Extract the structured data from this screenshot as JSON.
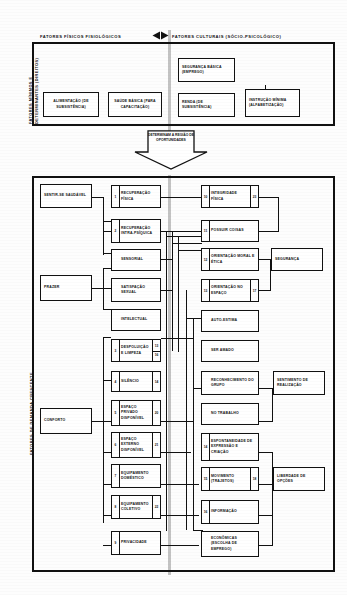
{
  "headers": {
    "left": "FATORES FÍSICOS FISIOLÓGICOS",
    "right": "FATORES CULTURAIS (SÓCIO-PSICOLÓGICO)",
    "arrow_icon": "double-arrow-horizontal-icon"
  },
  "side_labels": {
    "top_panel": "FATORES MÍNIMOS E DETERMINANTES (DIREITOS)",
    "main_panel": "FATORES DE DEMANDA CRESCENTE"
  },
  "top_panel": {
    "boxes": [
      {
        "id": "alimentacao",
        "text": "ALIMENTAÇÃO (DE SUBSISTÊNCIA)"
      },
      {
        "id": "saude-basica",
        "text": "SAÚDE BÁSICA (PARA CAPACITAÇÃO)"
      },
      {
        "id": "seguranca-basica",
        "text": "SEGURANÇA BÁSICA (EMPREGO)"
      },
      {
        "id": "renda",
        "text": "RENDA (DE SUBSISTÊNCIA)"
      },
      {
        "id": "instrucao-minima",
        "text": "INSTRUÇÃO MÍNIMA (ALFABETIZAÇÃO)"
      }
    ]
  },
  "connector": {
    "label": "DETERMINAM A REGIÃO DE OPORTUNIDADES"
  },
  "main_panel": {
    "col1": [
      {
        "id": "sentir-se-saudavel",
        "text": "SENTIR-SE SAUDÁVEL"
      },
      {
        "id": "prazer",
        "text": "PRAZER"
      },
      {
        "id": "conforto",
        "text": "CONFORTO"
      }
    ],
    "col2": [
      {
        "id": "recuperacao-fisica",
        "text": "RECUPERAÇÃO FÍSICA",
        "nl": "1",
        "nr": ""
      },
      {
        "id": "recuperacao-intra",
        "text": "RECUPERAÇÃO INTRA-PSÍQUICA",
        "nl": "2",
        "nr": ""
      },
      {
        "id": "sensorial",
        "text": "SENSORIAL",
        "nl": "",
        "nr": ""
      },
      {
        "id": "satisfacao-sexual",
        "text": "SATISFAÇÃO SEXUAL",
        "nl": "",
        "nr": ""
      },
      {
        "id": "intelectual",
        "text": "INTELECTUAL",
        "nl": "",
        "nr": ""
      },
      {
        "id": "despoluicao-limpeza",
        "text": "DESPOLUIÇÃO E LIMPEZA",
        "nl": "3",
        "nr": "13"
      },
      {
        "id": "silencio",
        "text": "SILÊNCIO",
        "nl": "4",
        "nr": "14"
      },
      {
        "id": "espaco-privado",
        "text": "ESPAÇO PRIVADO DISPONÍVEL",
        "nl": "5",
        "nr": "20"
      },
      {
        "id": "espaco-externo",
        "text": "ESPAÇO EXTERNO DISPONÍVEL",
        "nl": "6",
        "nr": "21"
      },
      {
        "id": "equipamento-domestico",
        "text": "EQUIPAMENTO DOMÉSTICO",
        "nl": "7",
        "nr": ""
      },
      {
        "id": "equipamento-coletivo",
        "text": "EQUIPAMENTO COLETIVO",
        "nl": "8",
        "nr": "22"
      },
      {
        "id": "privacidade",
        "text": "PRIVACIDADE",
        "nl": "9",
        "nr": ""
      }
    ],
    "col2_extra_tag": "16",
    "col3": [
      {
        "id": "integridade-fisica",
        "text": "INTEGRIDADE FÍSICA",
        "nl": "10",
        "nr": "23"
      },
      {
        "id": "possuir-coisas",
        "text": "POSSUIR COISAS",
        "nl": "11",
        "nr": ""
      },
      {
        "id": "orientacao-moral",
        "text": "ORIENTAÇÃO MORAL E ÉTICA",
        "nl": "12",
        "nr": ""
      },
      {
        "id": "orientacao-espaco",
        "text": "ORIENTAÇÃO NO ESPAÇO",
        "nl": "13",
        "nr": "17"
      },
      {
        "id": "auto-estima",
        "text": "AUTO-ESTIMA",
        "nl": "",
        "nr": ""
      },
      {
        "id": "ser-amado",
        "text": "SER AMADO",
        "nl": "",
        "nr": ""
      },
      {
        "id": "reconhecimento-grupo",
        "text": "RECONHECIMENTO DO GRUPO",
        "nl": "",
        "nr": ""
      },
      {
        "id": "no-trabalho",
        "text": "NO TRABALHO",
        "nl": "",
        "nr": ""
      },
      {
        "id": "espontaneidade",
        "text": "ESPONTANEIDADE DE EXPRESSÃO E CRIAÇÃO",
        "nl": "14",
        "nr": ""
      },
      {
        "id": "movimento",
        "text": "MOVIMENTO (TRAJETOS)",
        "nl": "15",
        "nr": "18"
      },
      {
        "id": "informacao",
        "text": "INFORMAÇÃO",
        "nl": "16",
        "nr": ""
      },
      {
        "id": "economicas",
        "text": "ECONÔMICAS (ESCOLHA DE EMPREGO)",
        "nl": "",
        "nr": ""
      }
    ],
    "col4": [
      {
        "id": "seguranca",
        "text": "SEGURANÇA"
      },
      {
        "id": "sentimento-realizacao",
        "text": "SENTIMENTO DE REALIZAÇÃO"
      },
      {
        "id": "liberdade-opcoes",
        "text": "LIBERDADE DE OPÇÕES"
      }
    ]
  },
  "colors": {
    "ink": "#111111",
    "paper": "#fdfdfd",
    "band": "#b9b9b9"
  }
}
